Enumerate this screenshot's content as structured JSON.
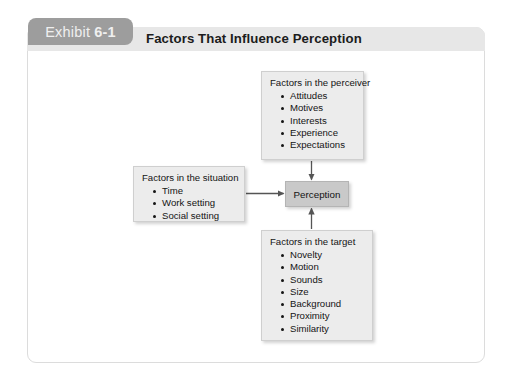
{
  "exhibit": {
    "tab_label": "Exhibit",
    "tab_number": "6-1",
    "title": "Factors That Influence Perception"
  },
  "diagram": {
    "type": "influence-diagram",
    "center_node": {
      "label": "Perception"
    },
    "nodes": [
      {
        "id": "perceiver",
        "title": "Factors in the perceiver",
        "items": [
          "Attitudes",
          "Motives",
          "Interests",
          "Experience",
          "Expectations"
        ]
      },
      {
        "id": "situation",
        "title": "Factors in the situation",
        "items": [
          "Time",
          "Work setting",
          "Social setting"
        ]
      },
      {
        "id": "target",
        "title": "Factors in the target",
        "items": [
          "Novelty",
          "Motion",
          "Sounds",
          "Size",
          "Background",
          "Proximity",
          "Similarity"
        ]
      }
    ],
    "connectors": [
      {
        "from": "perceiver",
        "to": "center_node",
        "direction": "down"
      },
      {
        "from": "situation",
        "to": "center_node",
        "direction": "right"
      },
      {
        "from": "target",
        "to": "center_node",
        "direction": "up"
      }
    ]
  },
  "colors": {
    "tab_background": "#9d9d9d",
    "header_band": "#e7e7e7",
    "box_fill": "#ececec",
    "center_box_fill": "#c9c9c9",
    "frame_border": "#dcdcdc",
    "text": "#141414",
    "connector": "#555555"
  }
}
